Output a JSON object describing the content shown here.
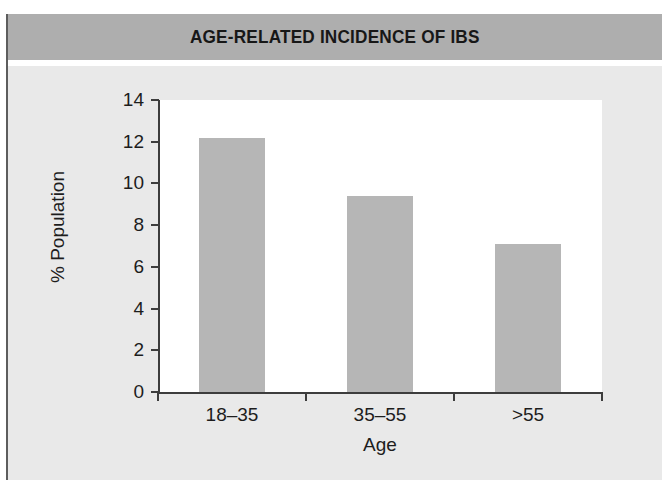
{
  "figure": {
    "title": "AGE-RELATED INCIDENCE OF IBS",
    "header_color": "#aeaeae",
    "panel_color": "#e9e9e9",
    "plot_color": "#ffffff",
    "bar_color": "#b6b6b6",
    "axis_color": "#3d3d3d",
    "text_color": "#1d1d1d"
  },
  "chart_data": {
    "type": "bar",
    "title": "AGE-RELATED INCIDENCE OF IBS",
    "xlabel": "Age",
    "ylabel": "% Population",
    "categories": [
      "18–35",
      "35–55",
      ">55"
    ],
    "values": [
      12.2,
      9.4,
      7.1
    ],
    "series": [
      {
        "name": "% Population",
        "values": [
          12.2,
          9.4,
          7.1
        ]
      }
    ],
    "ylim": [
      0,
      14
    ],
    "xlim": [
      0,
      3
    ],
    "ytick_labels": [
      "0",
      "2",
      "4",
      "6",
      "8",
      "10",
      "12",
      "14"
    ],
    "ytick_values": [
      0,
      2,
      4,
      6,
      8,
      10,
      12,
      14
    ],
    "xtick_labels": [
      "18–35",
      "35–55",
      ">55"
    ],
    "grid": false,
    "legend": false,
    "legend_position": "none",
    "bar_color": "#b6b6b6"
  }
}
